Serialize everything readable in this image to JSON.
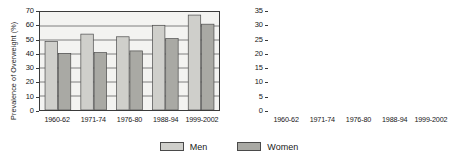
{
  "legend": {
    "items": [
      {
        "label": "Men",
        "color": "#cfcfcb",
        "name": "legend-men"
      },
      {
        "label": "Women",
        "color": "#a9a9a4",
        "name": "legend-women"
      }
    ]
  },
  "chart_data": [
    {
      "id": "overweight",
      "type": "bar",
      "title": "",
      "xlabel": "",
      "ylabel": "Prevalence of Overweight (%)",
      "ylim": [
        0,
        70
      ],
      "yticks": [
        0,
        10,
        20,
        30,
        40,
        50,
        60,
        70
      ],
      "grid": true,
      "legend_position": "bottom-center",
      "categories": [
        "1960-62",
        "1971-74",
        "1976-80",
        "1988-94",
        "1999-2002"
      ],
      "series": [
        {
          "name": "Men",
          "color": "#cfcfcb",
          "values": [
            49.0,
            54.2,
            52.3,
            60.5,
            67.8
          ]
        },
        {
          "name": "Women",
          "color": "#a9a9a4",
          "values": [
            40.3,
            41.0,
            42.2,
            51.0,
            61.3
          ]
        }
      ]
    },
    {
      "id": "obesity",
      "type": "bar",
      "title": "",
      "xlabel": "",
      "ylabel": "Prevalence of Obesity (%)",
      "ylim": [
        0,
        35
      ],
      "yticks": [
        0,
        5,
        10,
        15,
        20,
        25,
        30,
        35
      ],
      "grid": true,
      "legend_position": "bottom-center",
      "categories": [
        "1960-62",
        "1971-74",
        "1976-80",
        "1988-94",
        "1999-2002"
      ],
      "series": [
        {
          "name": "Men",
          "color": "#cfcfcb",
          "values": [
            10.7,
            12.0,
            12.5,
            20.5,
            27.7
          ]
        },
        {
          "name": "Women",
          "color": "#a9a9a4",
          "values": [
            15.8,
            16.8,
            17.1,
            26.0,
            34.2
          ]
        }
      ]
    }
  ]
}
